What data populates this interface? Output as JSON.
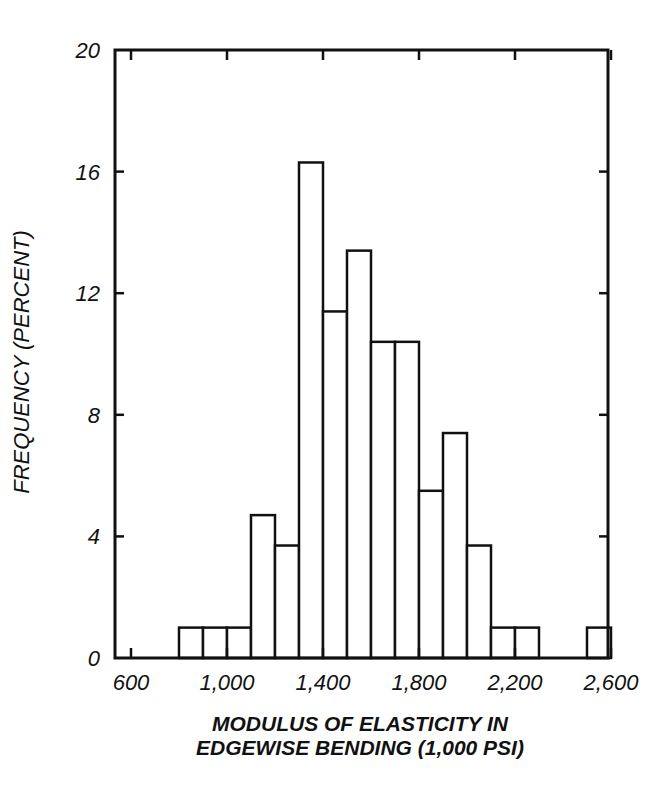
{
  "chart_data": {
    "type": "bar",
    "subtype": "histogram",
    "title": "",
    "xlabel": "MODULUS OF ELASTICITY IN EDGEWISE BENDING (1,000 PSI)",
    "xlabel_lines": [
      "MODULUS OF ELASTICITY IN",
      "EDGEWISE BENDING (1,000 PSI)"
    ],
    "ylabel": "FREQUENCY (PERCENT)",
    "xlim": [
      450,
      2650
    ],
    "ylim": [
      0,
      20
    ],
    "x_ticks": [
      600,
      1000,
      1400,
      1800,
      2200,
      2600
    ],
    "x_tick_labels": [
      "600",
      "1,000",
      "1,400",
      "1,800",
      "2,200",
      "2,600"
    ],
    "y_ticks": [
      0,
      4,
      8,
      12,
      16,
      20
    ],
    "y_tick_labels": [
      "0",
      "4",
      "8",
      "12",
      "16",
      "20"
    ],
    "grid": false,
    "legend": null,
    "bin_width": 100,
    "bins": [
      {
        "start": 800,
        "end": 900,
        "value": 1.0
      },
      {
        "start": 900,
        "end": 1000,
        "value": 1.0
      },
      {
        "start": 1000,
        "end": 1100,
        "value": 1.0
      },
      {
        "start": 1100,
        "end": 1200,
        "value": 4.7
      },
      {
        "start": 1200,
        "end": 1300,
        "value": 3.7
      },
      {
        "start": 1300,
        "end": 1400,
        "value": 16.3
      },
      {
        "start": 1400,
        "end": 1500,
        "value": 11.4
      },
      {
        "start": 1500,
        "end": 1600,
        "value": 13.4
      },
      {
        "start": 1600,
        "end": 1700,
        "value": 10.4
      },
      {
        "start": 1700,
        "end": 1800,
        "value": 10.4
      },
      {
        "start": 1800,
        "end": 1900,
        "value": 5.5
      },
      {
        "start": 1900,
        "end": 2000,
        "value": 7.4
      },
      {
        "start": 2000,
        "end": 2100,
        "value": 3.7
      },
      {
        "start": 2100,
        "end": 2200,
        "value": 1.0
      },
      {
        "start": 2200,
        "end": 2300,
        "value": 1.0
      },
      {
        "start": 2500,
        "end": 2600,
        "value": 1.0
      }
    ],
    "categories": [
      "800-900",
      "900-1000",
      "1000-1100",
      "1100-1200",
      "1200-1300",
      "1300-1400",
      "1400-1500",
      "1500-1600",
      "1600-1700",
      "1700-1800",
      "1800-1900",
      "1900-2000",
      "2000-2100",
      "2100-2200",
      "2200-2300",
      "2500-2600"
    ],
    "values": [
      1.0,
      1.0,
      1.0,
      4.7,
      3.7,
      16.3,
      11.4,
      13.4,
      10.4,
      10.4,
      5.5,
      7.4,
      3.7,
      1.0,
      1.0,
      1.0
    ]
  },
  "axes": {
    "y_title": "FREQUENCY (PERCENT)",
    "x_title_line1": "MODULUS OF ELASTICITY IN",
    "x_title_line2": "EDGEWISE BENDING (1,000 PSI)"
  },
  "style": {
    "line_color": "#111111",
    "bar_fill": "#ffffff",
    "background": "#ffffff"
  }
}
